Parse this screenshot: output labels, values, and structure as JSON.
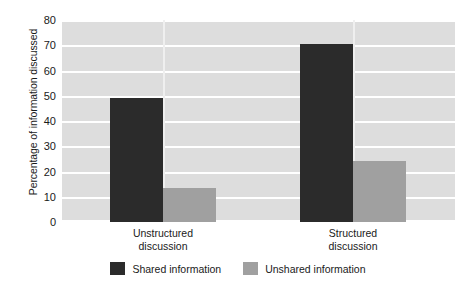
{
  "chart_data": {
    "type": "bar",
    "title": "",
    "xlabel": "",
    "ylabel": "Percentage of information discussed",
    "ylim": [
      0,
      80
    ],
    "yticks": [
      0,
      10,
      20,
      30,
      40,
      50,
      60,
      70,
      80
    ],
    "ytick_labels": [
      "0",
      "10",
      "20",
      "30",
      "40",
      "50",
      "60",
      "70",
      "80"
    ],
    "grid": true,
    "legend_position": "bottom",
    "categories": [
      "Unstructured discussion",
      "Structured discussion"
    ],
    "category_lines": [
      [
        "Unstructured",
        "discussion"
      ],
      [
        "Structured",
        "discussion"
      ]
    ],
    "series": [
      {
        "name": "Shared information",
        "color": "#2b2b2b",
        "values": [
          49,
          70.5
        ]
      },
      {
        "name": "Unshared information",
        "color": "#a0a0a0",
        "values": [
          13.5,
          24
        ]
      }
    ],
    "plot_background": "#dddddd",
    "gridline_color": "#ffffff",
    "figure_background": "#ffffff"
  }
}
